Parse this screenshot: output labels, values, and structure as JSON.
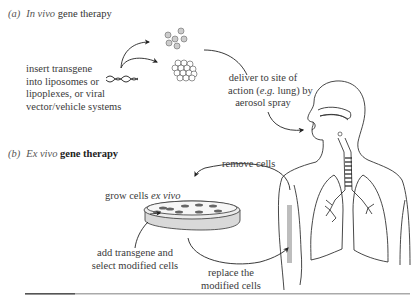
{
  "figure": {
    "panel_a": {
      "label": "(a)",
      "title_italic": "In vivo",
      "title_rest": "gene therapy",
      "step1": [
        "insert transgene",
        "into liposomes or",
        "lipoplexes, or viral",
        "vector/vehicle systems"
      ],
      "step2_line1": "deliver to site of",
      "step2_line2_pre": "action (",
      "step2_line2_italic": "e.g.",
      "step2_line2_post": " lung) by",
      "step2_line3": "aerosol spray",
      "icons": [
        "dna-strand-icon",
        "liposome-cluster-icon",
        "lipoplex-aggregate-icon"
      ]
    },
    "panel_b": {
      "label": "(b)",
      "title_italic": "Ex vivo",
      "title_rest": "gene therapy",
      "remove_label": "remove cells",
      "grow_label_pre": "grow cells ",
      "grow_label_italic": "ex vivo",
      "add_label": [
        "add transgene and",
        "select modified cells"
      ],
      "replace_label": [
        "replace the",
        "modified cells"
      ],
      "icons": [
        "petri-dish-icon",
        "human-torso-lungs-icon",
        "arm-vein-icon"
      ]
    }
  }
}
